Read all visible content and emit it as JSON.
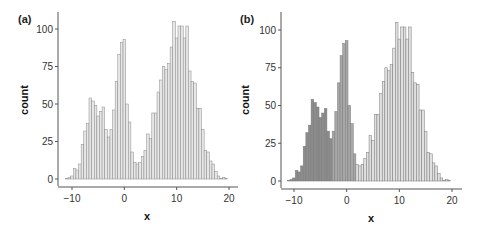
{
  "chart_data": [
    {
      "panel_label": "(a)",
      "type": "bar",
      "title": "",
      "xlabel": "x",
      "ylabel": "count",
      "xlim": [
        -12,
        21
      ],
      "ylim": [
        0,
        110
      ],
      "xticks": [
        -10,
        0,
        10,
        20
      ],
      "xtick_labels": [
        "-10",
        "0",
        "10",
        "20"
      ],
      "yticks": [
        0,
        25,
        50,
        75,
        100
      ],
      "ytick_labels": [
        "0",
        "25",
        "50",
        "75",
        "100"
      ],
      "grid": false,
      "legend": null,
      "bin_width": 0.5,
      "bin_start": -11.25,
      "values": [
        0.5,
        1,
        2,
        7,
        6,
        10,
        23,
        32,
        37,
        54,
        52,
        49,
        42,
        45,
        48,
        33,
        28,
        33,
        46,
        65,
        83,
        91,
        93,
        50,
        38,
        18,
        11,
        10,
        11,
        15,
        19,
        30,
        27,
        44,
        44,
        58,
        66,
        75,
        73,
        77,
        88,
        105,
        94,
        102,
        102,
        94,
        102,
        72,
        65,
        64,
        47,
        47,
        33,
        19,
        18,
        12,
        10,
        5,
        2,
        0.5,
        1,
        0.5
      ],
      "colors": {
        "fill": "#e6e6e6",
        "stroke": "#8a8a8a"
      }
    },
    {
      "panel_label": "(b)",
      "type": "bar",
      "title": "",
      "xlabel": "x",
      "ylabel": "count",
      "xlim": [
        -12,
        21
      ],
      "ylim": [
        0,
        110
      ],
      "xticks": [
        -10,
        0,
        10,
        20
      ],
      "xtick_labels": [
        "-10",
        "0",
        "10",
        "20"
      ],
      "yticks": [
        0,
        25,
        50,
        75,
        100
      ],
      "ytick_labels": [
        "0",
        "25",
        "50",
        "75",
        "100"
      ],
      "grid": false,
      "legend": null,
      "bin_width": 0.5,
      "bin_start": -11.25,
      "values": [
        0.5,
        1,
        2,
        7,
        6,
        10,
        23,
        32,
        37,
        54,
        52,
        49,
        42,
        45,
        48,
        33,
        28,
        33,
        46,
        65,
        83,
        91,
        93,
        50,
        38,
        18,
        11,
        10,
        11,
        15,
        19,
        30,
        27,
        44,
        44,
        58,
        66,
        75,
        73,
        77,
        88,
        105,
        94,
        102,
        102,
        94,
        102,
        72,
        65,
        64,
        47,
        47,
        33,
        19,
        18,
        12,
        10,
        5,
        2,
        0.5,
        1,
        0.5
      ],
      "groups": [
        {
          "name": "cluster-1",
          "x_range": [
            -11.5,
            -2.5
          ],
          "fill": "#8c8c8c"
        },
        {
          "name": "cluster-2",
          "x_range": [
            -2.5,
            2.0
          ],
          "fill": "#a8a8a8"
        },
        {
          "name": "cluster-3",
          "x_range": [
            2.0,
            21
          ],
          "fill": "#e0e0e0"
        }
      ],
      "colors": {
        "stroke": "#7a7a7a"
      }
    }
  ]
}
